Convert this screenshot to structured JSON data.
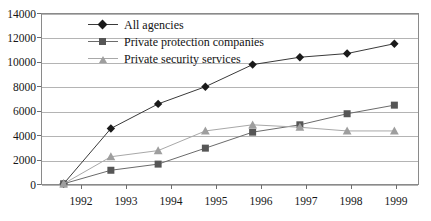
{
  "chart_data": {
    "type": "line",
    "title": "",
    "xlabel": "",
    "ylabel": "",
    "categories": [
      "1992",
      "1993",
      "1994",
      "1995",
      "1996",
      "1997",
      "1998",
      "1999"
    ],
    "x": [
      1992,
      1993,
      1994,
      1995,
      1996,
      1997,
      1998,
      1999
    ],
    "ylim": [
      0,
      14000
    ],
    "yticks": [
      0,
      2000,
      4000,
      6000,
      8000,
      10000,
      12000,
      14000
    ],
    "ytick_labels": [
      "0",
      "2000",
      "4000",
      "6000",
      "8000",
      "10000",
      "12000",
      "14000"
    ],
    "grid": true,
    "legend_position": "top-center-inside",
    "series": [
      {
        "name": "All agencies",
        "marker": "diamond",
        "color": "#1a1a1a",
        "line_color": "#3a3a3a",
        "values": [
          100,
          4600,
          6600,
          8000,
          9800,
          10400,
          10700,
          11500
        ]
      },
      {
        "name": "Private protection companies",
        "marker": "square",
        "color": "#565656",
        "line_color": "#6b6b6b",
        "values": [
          100,
          1200,
          1700,
          3000,
          4300,
          4900,
          5800,
          6500
        ]
      },
      {
        "name": "Private security services",
        "marker": "triangle",
        "color": "#9e9e9e",
        "line_color": "#a8a8a8",
        "values": [
          100,
          2300,
          2800,
          4400,
          4900,
          4700,
          4400,
          4400
        ]
      }
    ]
  },
  "axes": {
    "y_labels": [
      "14000",
      "12000",
      "10000",
      "8000",
      "6000",
      "4000",
      "2000",
      "0"
    ],
    "x_labels": [
      "1992",
      "1993",
      "1994",
      "1995",
      "1996",
      "1997",
      "1998",
      "1999"
    ]
  },
  "legend": {
    "items": [
      {
        "label": "All agencies",
        "marker": "diamond-icon",
        "color": "#1a1a1a"
      },
      {
        "label": "Private protection companies",
        "marker": "square-icon",
        "color": "#565656"
      },
      {
        "label": "Private security services",
        "marker": "triangle-icon",
        "color": "#9e9e9e"
      }
    ]
  },
  "colors": {
    "frame": "#8a8a8a",
    "grid": "#b4b4b4",
    "background": "#ffffff",
    "text": "#161616"
  }
}
